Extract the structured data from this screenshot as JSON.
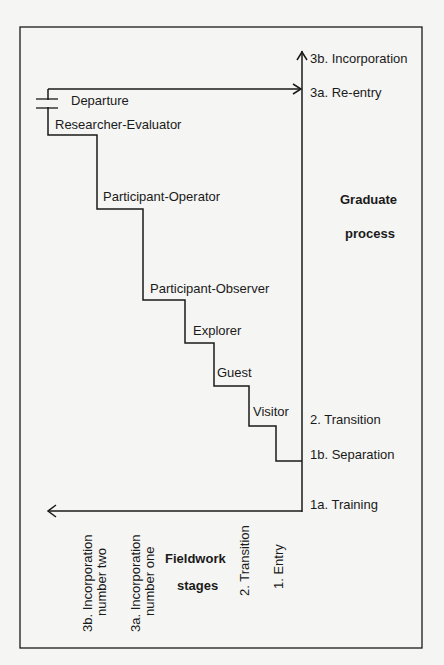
{
  "diagram": {
    "stair_labels": {
      "departure": "Departure",
      "researcher_evaluator": "Researcher-Evaluator",
      "participant_operator": "Participant-Operator",
      "participant_observer": "Participant-Observer",
      "explorer": "Explorer",
      "guest": "Guest",
      "visitor": "Visitor"
    },
    "graduate_process": {
      "title_line1": "Graduate",
      "title_line2": "process",
      "stages": {
        "incorporation": "3b.  Incorporation",
        "reentry": "3a.   Re-entry",
        "transition": "2.   Transition",
        "separation": "1b.   Separation",
        "training": "1a.   Training"
      }
    },
    "fieldwork_stages": {
      "title_line1": "Fieldwork",
      "title_line2": "stages",
      "stages": {
        "incorp_two_line1": "3b.  Incorporation",
        "incorp_two_line2": "number two",
        "incorp_one_line1": "3a.  Incorporation",
        "incorp_one_line2": "number one",
        "transition": "2.  Transition",
        "entry": "1.  Entry"
      }
    },
    "colors": {
      "line": "#1a1a1a",
      "background": "#f5f5f3"
    }
  }
}
